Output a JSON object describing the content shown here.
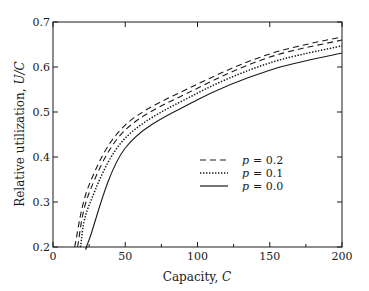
{
  "chart_data": {
    "type": "line",
    "title": "",
    "xlabel": "Capacity, C",
    "xlabel_text": "Capacity, ",
    "xlabel_var": "C",
    "ylabel": "Relative utilization, U/C",
    "ylabel_text": "Relative utilization, ",
    "ylabel_var": "U/C",
    "xlim": [
      0,
      200
    ],
    "ylim": [
      0.2,
      0.7
    ],
    "xticks": [
      0,
      50,
      100,
      150,
      200
    ],
    "xticks_minor": [
      25,
      75,
      125,
      175
    ],
    "yticks": [
      0.2,
      0.3,
      0.4,
      0.5,
      0.6,
      0.7
    ],
    "xtick_labels": [
      "0",
      "50",
      "100",
      "150",
      "200"
    ],
    "ytick_labels": [
      "0.2",
      "0.3",
      "0.4",
      "0.5",
      "0.6",
      "0.7"
    ],
    "grid": false,
    "legend_position": "center-right",
    "legend": [
      {
        "label": "p = 0.2",
        "var": "p",
        "value": "= 0.2",
        "style": "dashed"
      },
      {
        "label": "p = 0.1",
        "var": "p",
        "value": "= 0.1",
        "style": "dotted"
      },
      {
        "label": "p = 0.0",
        "var": "p",
        "value": "= 0.0",
        "style": "solid"
      }
    ],
    "series": [
      {
        "name": "p = 0.2 (upper)",
        "style": "dashed",
        "x": [
          15,
          25,
          50,
          100,
          150,
          200
        ],
        "y": [
          0.2,
          0.338,
          0.471,
          0.562,
          0.629,
          0.667
        ]
      },
      {
        "name": "p = 0.2 (lower)",
        "style": "dashed",
        "x": [
          17,
          25,
          50,
          100,
          150,
          200
        ],
        "y": [
          0.2,
          0.32,
          0.46,
          0.553,
          0.622,
          0.66
        ]
      },
      {
        "name": "p = 0.1",
        "style": "dotted",
        "x": [
          19,
          25,
          50,
          100,
          150,
          200
        ],
        "y": [
          0.2,
          0.293,
          0.442,
          0.542,
          0.609,
          0.647
        ]
      },
      {
        "name": "p = 0.0",
        "style": "solid",
        "x": [
          23.5,
          25,
          50,
          100,
          150,
          200
        ],
        "y": [
          0.2,
          0.216,
          0.42,
          0.527,
          0.593,
          0.631
        ]
      }
    ]
  },
  "colors": {
    "line": "#1a1a1a",
    "background": "#ffffff"
  }
}
